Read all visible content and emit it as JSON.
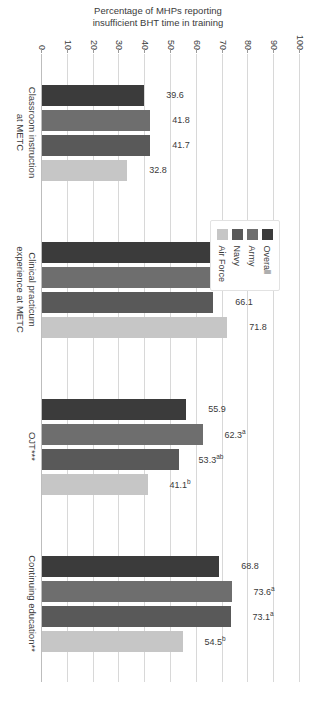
{
  "chart_data": {
    "type": "bar",
    "title": "",
    "subtitle": "",
    "xlabel": "",
    "ylabel": "Percentage of MHPs reporting\ninsufficient BHT time in training",
    "ylim": [
      0,
      100
    ],
    "ytick_step": 10,
    "yticks": [
      "0",
      "10",
      "20",
      "30",
      "40",
      "50",
      "60",
      "70",
      "80",
      "90",
      "100"
    ],
    "grid": true,
    "orientation": "vertical",
    "legend_position": "upper-left",
    "categories": [
      "Classroom instruction\nat METC",
      "Clinical practicum\nexperience at METC",
      "OJT***",
      "Continuing education**"
    ],
    "series": [
      {
        "name": "Overall",
        "color": "#3b3b3b",
        "values": [
          39.6,
          69.8,
          55.9,
          68.8
        ],
        "labels": [
          "39.6",
          "69.8",
          "55.9",
          "68.8"
        ],
        "superscripts": [
          "",
          "",
          "",
          ""
        ]
      },
      {
        "name": "Army",
        "color": "#6e6e6e",
        "values": [
          41.8,
          69.8,
          62.3,
          73.6
        ],
        "labels": [
          "41.8",
          "69.8",
          "62.3",
          "73.6"
        ],
        "superscripts": [
          "",
          "",
          "a",
          "a"
        ]
      },
      {
        "name": "Navy",
        "color": "#595959",
        "values": [
          41.7,
          66.1,
          53.3,
          73.1
        ],
        "labels": [
          "41.7",
          "66.1",
          "53.3",
          "73.1"
        ],
        "superscripts": [
          "",
          "",
          "ab",
          "a"
        ]
      },
      {
        "name": "Air Force",
        "color": "#c6c6c6",
        "values": [
          32.8,
          71.8,
          41.1,
          54.5
        ],
        "labels": [
          "32.8",
          "71.8",
          "41.1",
          "54.5"
        ],
        "superscripts": [
          "",
          "",
          "b",
          "b"
        ]
      }
    ]
  },
  "legend": {
    "items": [
      {
        "label": "Overall",
        "color": "#3b3b3b"
      },
      {
        "label": "Army",
        "color": "#6e6e6e"
      },
      {
        "label": "Navy",
        "color": "#595959"
      },
      {
        "label": "Air Force",
        "color": "#c6c6c6"
      }
    ]
  }
}
